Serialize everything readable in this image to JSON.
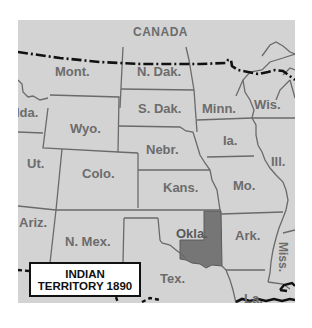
{
  "map": {
    "title": "INDIAN TERRITORY 1890",
    "legend": {
      "line1": "INDIAN",
      "line2": "TERRITORY 1890"
    },
    "colors": {
      "land": "#d3d3d3",
      "highlight_indian_territory": "#767676",
      "state_border": "#6a6a6a",
      "international_border": "#111111",
      "label_text": "#6c6c6c",
      "background": "#ffffff"
    },
    "labels": {
      "canada": "CANADA",
      "mont": "Mont.",
      "ndak": "N. Dak.",
      "sdak": "S. Dak.",
      "minn": "Minn.",
      "wis": "Wis.",
      "ida": "Ida.",
      "wyo": "Wyo.",
      "nebr": "Nebr.",
      "ia": "Ia.",
      "ill": "Ill.",
      "ut": "Ut.",
      "colo": "Colo.",
      "kans": "Kans.",
      "mo": "Mo.",
      "ariz": "Ariz.",
      "nmex": "N. Mex.",
      "okla": "Okla.",
      "ark": "Ark.",
      "miss": "Miss.",
      "tex": "Tex.",
      "la": "La."
    }
  }
}
